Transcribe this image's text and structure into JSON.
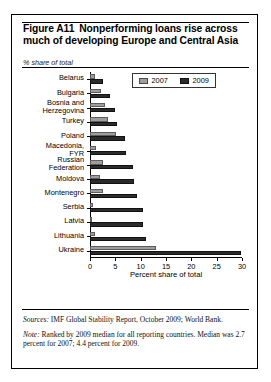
{
  "figure": {
    "label": "Figure A11",
    "title_line1": "Nonperforming loans rise across",
    "title_line2": "much of developing Europe and Central Asia",
    "axis_note": "% share of total"
  },
  "legend": {
    "items": [
      {
        "label": "2007",
        "color": "#9d9d9d"
      },
      {
        "label": "2009",
        "color": "#2b2b2b"
      }
    ]
  },
  "footnotes": {
    "sources_lead": "Sources:",
    "sources_text": " IMF Global Stability Report, October 2009; World Bank.",
    "note_lead": "Note:",
    "note_text": " Ranked by 2009 median for all reporting countries. Median was 2.7 percent for 2007; 4.4 percent for 2009."
  },
  "chart_data": {
    "type": "bar",
    "orientation": "horizontal",
    "xlabel": "Percent share of total",
    "ylabel": "",
    "unit_note": "% share of total",
    "xlim": [
      0,
      30
    ],
    "xticks": [
      0,
      5,
      10,
      15,
      20,
      25,
      30
    ],
    "grid": false,
    "legend_position": "top-right",
    "categories": [
      "Belarus",
      "Bulgaria",
      "Bosnia and\nHerzegovina",
      "Turkey",
      "Poland",
      "Macedonia,\nFYR",
      "Russian\nFederation",
      "Moldova",
      "Montenegro",
      "Serbia",
      "Latvia",
      "Lithuania",
      "Ukraine"
    ],
    "series": [
      {
        "name": "2007",
        "color": "#9d9d9d",
        "values": [
          1.0,
          2.1,
          3.0,
          3.5,
          5.2,
          1.2,
          2.5,
          2.0,
          2.5,
          0.6,
          0.4,
          1.0,
          13.0
        ]
      },
      {
        "name": "2009",
        "color": "#2b2b2b",
        "values": [
          2.5,
          4.0,
          5.0,
          5.3,
          7.0,
          7.2,
          8.5,
          8.6,
          9.2,
          10.5,
          10.5,
          11.0,
          29.8
        ]
      }
    ],
    "annotations": {
      "median_2007": 2.7,
      "median_2009": 4.4
    }
  }
}
